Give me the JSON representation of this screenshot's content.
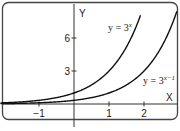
{
  "chart_data": {
    "type": "line",
    "title": "",
    "xlabel": "X",
    "ylabel": "Y",
    "xlim": [
      -2,
      3
    ],
    "ylim": [
      -1,
      8
    ],
    "grid": false,
    "x_ticks": [
      -1,
      1,
      2
    ],
    "y_ticks": [
      3,
      6
    ],
    "x_tick_labels": [
      "−1",
      "1",
      "2"
    ],
    "y_tick_labels": [
      "3",
      "6"
    ],
    "series": [
      {
        "name": "y = 3^x",
        "label_text": "y = 3",
        "label_exp": "x",
        "formula": "3^x",
        "x": [
          -2,
          -1,
          0,
          0.5,
          1,
          1.5,
          1.9
        ],
        "values": [
          0.11,
          0.33,
          1,
          1.73,
          3,
          5.2,
          8.06
        ]
      },
      {
        "name": "y = 3^(x-1)",
        "label_text": "y = 3",
        "label_exp": "x−1",
        "formula": "3^(x-1)",
        "x": [
          -2,
          -1,
          0,
          1,
          1.5,
          2,
          2.5,
          2.9
        ],
        "values": [
          0.04,
          0.11,
          0.33,
          1,
          1.73,
          3,
          5.2,
          8.06
        ]
      }
    ],
    "annotations": [
      "y = 3^x",
      "y = 3^(x−1)"
    ]
  },
  "colors": {
    "curve": "#111111",
    "axis": "#333333",
    "frame": "#444444",
    "background": "#ffffff"
  }
}
